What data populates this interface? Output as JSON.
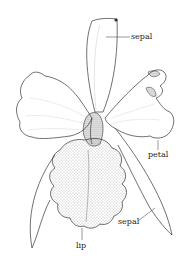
{
  "diagram": {
    "labels": {
      "sepal_top": "sepal",
      "petal": "petal",
      "sepal_bottom": "sepal",
      "lip": "lip"
    },
    "colors": {
      "ink": "#333333",
      "background": "#ffffff",
      "shade": "#888888"
    }
  }
}
